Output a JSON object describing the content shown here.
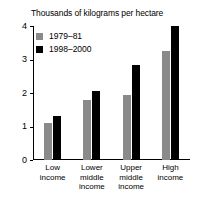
{
  "chart_data": {
    "type": "bar",
    "title": "Thousands of kilograms per hectare",
    "xlabel": "",
    "ylabel": "",
    "ylim": [
      0,
      4
    ],
    "yticks": [
      0,
      1,
      2,
      3,
      4
    ],
    "ytick_labels": [
      "0",
      "1",
      "2",
      "3",
      "4"
    ],
    "grid": false,
    "legend_position": "top-left",
    "categories": [
      "Low income",
      "Lower middle income",
      "Upper middle income",
      "High income"
    ],
    "category_lines": [
      [
        "Low",
        "income"
      ],
      [
        "Lower",
        "middle",
        "income"
      ],
      [
        "Upper",
        "middle",
        "income"
      ],
      [
        "High",
        "income"
      ]
    ],
    "series": [
      {
        "name": "1979–81",
        "color": "#8a8a8a",
        "values": [
          1.1,
          1.8,
          1.95,
          3.25
        ]
      },
      {
        "name": "1998–2000",
        "color": "#000000",
        "values": [
          1.3,
          2.05,
          2.85,
          4.0
        ]
      }
    ]
  },
  "legend": {
    "items": [
      {
        "label": "1979–81",
        "color": "#8a8a8a"
      },
      {
        "label": "1998–2000",
        "color": "#000000"
      }
    ]
  },
  "colors": {
    "series_1979_81": "#8a8a8a",
    "series_1998_2000": "#000000",
    "axis": "#000000",
    "background": "#ffffff"
  }
}
